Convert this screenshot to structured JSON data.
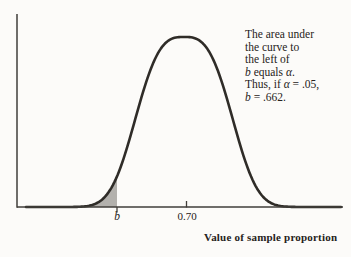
{
  "chart_data": {
    "type": "area",
    "curve": "normal distribution (bell curve) of the sample proportion",
    "title": "",
    "xlabel": "Value of sample proportion",
    "ylabel": "",
    "mean": 0.7,
    "x_tick_labels": [
      "b",
      "0.70"
    ],
    "grid": false,
    "legend": false,
    "shaded_region": {
      "description": "gray area under the curve to the left of b (left tail)",
      "area_equals": "α",
      "example_alpha": 0.05,
      "example_b": 0.662
    },
    "annotation_text": "The area under the curve to the left of b equals α. Thus, if α = .05, b = .662."
  },
  "annotation": {
    "lines": [
      [
        {
          "t": "The area under"
        }
      ],
      [
        {
          "t": "the curve to"
        }
      ],
      [
        {
          "t": "the left of"
        }
      ],
      [
        {
          "t": "b",
          "i": true
        },
        {
          "t": " equals "
        },
        {
          "t": "α",
          "i": true
        },
        {
          "t": "."
        }
      ],
      [
        {
          "t": "Thus, if "
        },
        {
          "t": "α",
          "i": true
        },
        {
          "t": " = .05,"
        }
      ],
      [
        {
          "t": "b",
          "i": true
        },
        {
          "t": " = .662."
        }
      ]
    ]
  },
  "axis": {
    "b_label": "b",
    "mean_label": "0.70",
    "x_title": "Value of sample proportion"
  },
  "colors": {
    "background": "#fcfbf9",
    "curve": "#2f2c28",
    "axis": "#413e3a",
    "shade": "#b3b1ad",
    "text": "#262220"
  }
}
